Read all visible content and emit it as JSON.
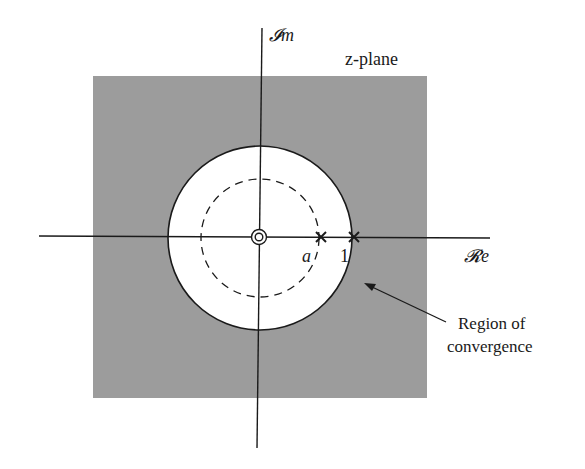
{
  "figure": {
    "plane_label": "z-plane",
    "imag_axis_label": "𝓘m",
    "real_axis_label": "𝓡e",
    "pole_labels": [
      "a",
      "1"
    ],
    "roc_label_line1": "Region of",
    "roc_label_line2": "convergence"
  },
  "colors": {
    "background": "#ffffff",
    "roc_fill": "#9c9c9c",
    "ink": "#1a1a1a"
  },
  "geometry": {
    "center": [
      260,
      237
    ],
    "unit_circle_radius": 92,
    "dashed_circle_radius": 59,
    "roc_square": {
      "x": 93,
      "y": 76,
      "w": 334,
      "h": 322
    },
    "pole_a_x": 321,
    "pole_1_x": 354,
    "zero_at_origin": true
  }
}
